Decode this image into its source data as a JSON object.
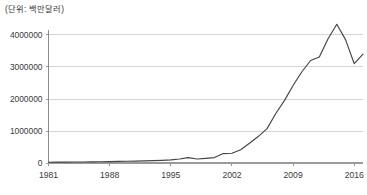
{
  "chart_data": {
    "type": "line",
    "title": "(단위: 백만달러)",
    "unit_note": "(단위: 백만달러)",
    "xlabel": "",
    "ylabel": "",
    "xlim": [
      1981,
      2017
    ],
    "ylim": [
      0,
      4400000
    ],
    "grid": true,
    "legend": "none",
    "yticks": [
      0,
      1000000,
      2000000,
      3000000,
      4000000
    ],
    "ytick_labels": [
      "0",
      "1000000",
      "2000000",
      "3000000",
      "4000000"
    ],
    "xticks": [
      1981,
      1988,
      1995,
      2002,
      2009,
      2016
    ],
    "xtick_labels": [
      "1981",
      "1988",
      "1995",
      "2002",
      "2009",
      "2016"
    ],
    "series": [
      {
        "name": "value",
        "color": "#454545",
        "x": [
          1981,
          1982,
          1983,
          1984,
          1985,
          1986,
          1987,
          1988,
          1989,
          1990,
          1991,
          1992,
          1993,
          1994,
          1995,
          1996,
          1997,
          1998,
          1999,
          2000,
          2001,
          2002,
          2003,
          2004,
          2005,
          2006,
          2007,
          2008,
          2009,
          2010,
          2011,
          2012,
          2013,
          2014,
          2015,
          2016,
          2017
        ],
        "values": [
          30000,
          32000,
          34000,
          36000,
          38000,
          41000,
          45000,
          50000,
          55000,
          60000,
          66000,
          72000,
          80000,
          90000,
          105000,
          130000,
          175000,
          130000,
          150000,
          175000,
          300000,
          310000,
          420000,
          620000,
          830000,
          1070000,
          1540000,
          1950000,
          2420000,
          2850000,
          3200000,
          3310000,
          3880000,
          4330000,
          3850000,
          3100000,
          3400000
        ],
        "annotations": [
          {
            "label": "peak",
            "x": 2014,
            "y": 4330000
          },
          {
            "label": "trough-after-peak",
            "x": 2016,
            "y": 3100000
          },
          {
            "label": "end",
            "x": 2017,
            "y": 3400000
          }
        ]
      }
    ]
  }
}
